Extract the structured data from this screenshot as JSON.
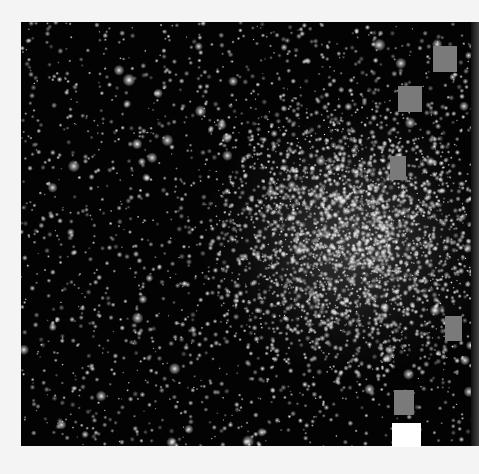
{
  "image": {
    "subject": "globular star cluster",
    "description": "Dense star field on black background with bright cluster core right of center",
    "colors": {
      "sky": "#030303",
      "star": "#ffffff",
      "occluder_gray": "#7a7a7a",
      "occluder_white": "#ffffff",
      "border": "#f4f4f4"
    }
  },
  "occluders": [
    {
      "color": "gray"
    },
    {
      "color": "gray"
    },
    {
      "color": "gray"
    },
    {
      "color": "gray"
    },
    {
      "color": "gray"
    },
    {
      "color": "white"
    }
  ]
}
